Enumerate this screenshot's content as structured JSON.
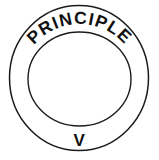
{
  "figure": {
    "kind": "circular-seal",
    "background_color": "#ffffff",
    "stroke_color": "#1b1b1b",
    "text_color": "#101010",
    "outer_ring": {
      "label": "outer circle",
      "center_x": 79,
      "center_y": 78,
      "radius_x": 70,
      "radius_y": 73,
      "stroke_width": 1.5
    },
    "inner_ring": {
      "label": "inner circle",
      "center_x": 79.5,
      "center_y": 79,
      "radius_x": 51.5,
      "radius_y": 47,
      "stroke_width": 1.4
    },
    "top_arc_text": "PRINCIPLE",
    "bottom_text": "V"
  }
}
